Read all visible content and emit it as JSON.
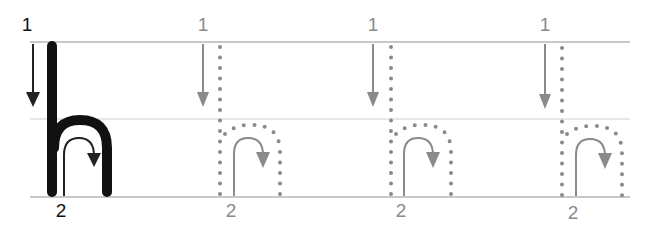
{
  "worksheet": {
    "letter": "h",
    "colors": {
      "guide_line": "#c8c8c8",
      "model_letter": "#111111",
      "model_arrow": "#222222",
      "trace_dots": "#8a8a8a",
      "trace_arrow": "#8a8a8a",
      "number_dark": "#111111",
      "number_light": "#8a8a8a"
    },
    "cells": [
      {
        "type": "model",
        "stroke1_label": "1",
        "stroke2_label": "2"
      },
      {
        "type": "trace",
        "stroke1_label": "1",
        "stroke2_label": "2"
      },
      {
        "type": "trace",
        "stroke1_label": "1",
        "stroke2_label": "2"
      },
      {
        "type": "trace",
        "stroke1_label": "1",
        "stroke2_label": "2"
      }
    ]
  }
}
